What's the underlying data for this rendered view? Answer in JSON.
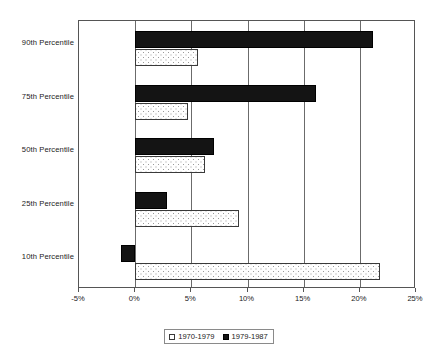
{
  "chart_data": {
    "type": "bar",
    "orientation": "horizontal",
    "title": "",
    "subtitle": "",
    "xlabel": "",
    "ylabel": "",
    "categories": [
      "90th Percentile",
      "75th Percentile",
      "50th Percentile",
      "25th Percentile",
      "10th Percentile"
    ],
    "series": [
      {
        "name": "1970-1979",
        "style": "white-dotted",
        "values": [
          5.6,
          4.7,
          6.2,
          9.2,
          21.8
        ]
      },
      {
        "name": "1979-1987",
        "style": "solid-black",
        "values": [
          21.2,
          16.1,
          7.0,
          2.8,
          -1.3
        ]
      }
    ],
    "xlim": [
      -5,
      25
    ],
    "xticks": [
      -5,
      0,
      5,
      10,
      15,
      20,
      25
    ],
    "xtick_labels": [
      "-5%",
      "0%",
      "5%",
      "10%",
      "15%",
      "20%",
      "25%"
    ],
    "grid": true,
    "grid_axis": "x",
    "legend_position": "bottom",
    "value_unit": "%"
  },
  "legend": {
    "entries": [
      {
        "label": "1970-1979",
        "swatch": "open-square-swatch"
      },
      {
        "label": "1979-1987",
        "swatch": "filled-square-swatch"
      }
    ]
  },
  "colors": {
    "series_1979_1987": "#141414",
    "series_1970_1979": "#ffffff",
    "axis": "#555555",
    "gridline": "#6b6b6b",
    "text": "#1a1a1a",
    "background": "#ffffff"
  }
}
